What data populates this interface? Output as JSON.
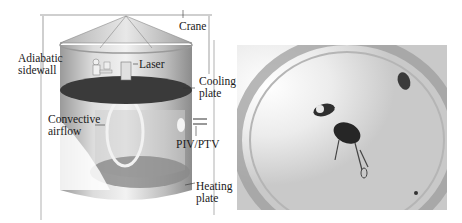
{
  "figure": {
    "left_panel": {
      "type": "schematic",
      "labels": {
        "crane": "Crane",
        "adiabatic_sidewall": "Adiabatic\nsidewall",
        "adiabatic_1": "Adiabatic",
        "adiabatic_2": "sidewall",
        "laser": "Laser",
        "cooling_1": "Cooling",
        "cooling_2": "plate",
        "convective_1": "Convective",
        "convective_2": "airflow",
        "piv": "PIV/PTV",
        "heating_1": "Heating",
        "heating_2": "plate"
      }
    },
    "right_panel": {
      "type": "photograph",
      "description": "Top-down view inside the cylindrical cell showing a person and equipment on the plate"
    },
    "colors": {
      "cylinder_light": "#e6e6e6",
      "cylinder_mid": "#b5b5b5",
      "plate_dark": "#3a3a3a",
      "roof": "#c8c8c8"
    }
  }
}
